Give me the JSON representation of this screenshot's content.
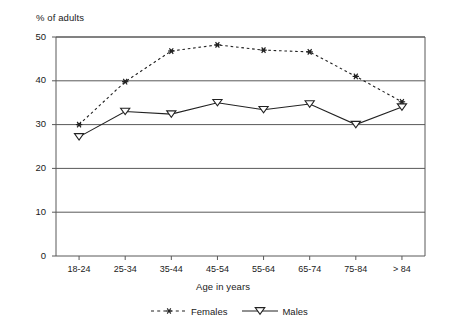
{
  "chart_data": {
    "type": "line",
    "title": "",
    "xlabel": "Age in years",
    "ylabel": "% of adults",
    "categories": [
      "18-24",
      "25-34",
      "35-44",
      "45-54",
      "55-64",
      "65-74",
      "75-84",
      "> 84"
    ],
    "series": [
      {
        "name": "Females",
        "marker": "asterisk",
        "linestyle": "dashed",
        "color": "#222222",
        "values": [
          30,
          39.8,
          46.8,
          48.2,
          47,
          46.6,
          41,
          35.2
        ]
      },
      {
        "name": "Males",
        "marker": "triangle-down-open",
        "linestyle": "solid",
        "color": "#222222",
        "values": [
          27.2,
          33,
          32.4,
          35,
          33.4,
          34.7,
          30,
          34
        ]
      }
    ],
    "ylim": [
      0,
      50
    ],
    "yticks": [
      0,
      10,
      20,
      30,
      40,
      50
    ],
    "ytick_labels": [
      "0",
      "10",
      "20",
      "30",
      "40",
      "50"
    ],
    "grid": "horizontal",
    "legend_position": "bottom"
  },
  "legend": {
    "items": [
      {
        "label": "Females"
      },
      {
        "label": "Males"
      }
    ]
  },
  "axes": {
    "y_title": "% of adults",
    "x_title": "Age in years"
  }
}
